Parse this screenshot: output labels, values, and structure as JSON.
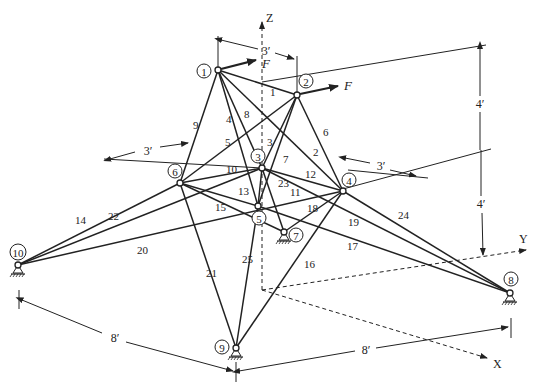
{
  "figure": {
    "type": "space-truss",
    "axes": {
      "x": "X",
      "y": "Y",
      "z": "Z"
    },
    "loads": [
      {
        "node": 1,
        "label": "F"
      },
      {
        "node": 2,
        "label": "F"
      }
    ],
    "dimensions": {
      "top_width": "3′",
      "left_offset": "3′",
      "right_offset": "3′",
      "upper_height": "4′",
      "lower_height": "4′",
      "base_left": "8′",
      "base_right": "8′"
    },
    "nodes": [
      {
        "id": "1",
        "x": 218,
        "y": 70,
        "lx": 204,
        "ly": 71
      },
      {
        "id": "2",
        "x": 297,
        "y": 95,
        "lx": 306,
        "ly": 81
      },
      {
        "id": "3",
        "x": 262,
        "y": 168,
        "lx": 258,
        "ly": 156
      },
      {
        "id": "4",
        "x": 343,
        "y": 191,
        "lx": 349,
        "ly": 180
      },
      {
        "id": "5",
        "x": 258,
        "y": 206,
        "lx": 259,
        "ly": 218
      },
      {
        "id": "6",
        "x": 180,
        "y": 183,
        "lx": 175,
        "ly": 171
      },
      {
        "id": "7",
        "x": 284,
        "y": 232,
        "lx": 296,
        "ly": 235
      },
      {
        "id": "8",
        "x": 510,
        "y": 293,
        "lx": 511,
        "ly": 279
      },
      {
        "id": "9",
        "x": 236,
        "y": 348,
        "lx": 222,
        "ly": 347
      },
      {
        "id": "10",
        "x": 18,
        "y": 265,
        "lx": 18,
        "ly": 252
      }
    ],
    "supports": [
      "7",
      "8",
      "9",
      "10"
    ],
    "members": [
      {
        "id": "1",
        "a": "1",
        "b": "2",
        "lx": 270,
        "ly": 96
      },
      {
        "id": "2",
        "a": "1",
        "b": "4",
        "lx": 313,
        "ly": 156
      },
      {
        "id": "3",
        "a": "2",
        "b": "5",
        "lx": 267,
        "ly": 146
      },
      {
        "id": "4",
        "a": "1",
        "b": "5",
        "lx": 226,
        "ly": 123
      },
      {
        "id": "5",
        "a": "2",
        "b": "6",
        "lx": 225,
        "ly": 146
      },
      {
        "id": "6",
        "a": "2",
        "b": "4",
        "lx": 323,
        "ly": 136
      },
      {
        "id": "7",
        "a": "2",
        "b": "3",
        "lx": 283,
        "ly": 163
      },
      {
        "id": "8",
        "a": "1",
        "b": "3",
        "lx": 244,
        "ly": 118
      },
      {
        "id": "9",
        "a": "1",
        "b": "6",
        "lx": 193,
        "ly": 129
      },
      {
        "id": "10",
        "a": "6",
        "b": "3",
        "lx": 226,
        "ly": 173
      },
      {
        "id": "11",
        "a": "3",
        "b": "5",
        "lx": 290,
        "ly": 196,
        "note": "4-5"
      },
      {
        "id": "12",
        "a": "3",
        "b": "4",
        "lx": 305,
        "ly": 178
      },
      {
        "id": "13",
        "a": "6",
        "b": "5",
        "lx": 238,
        "ly": 195
      },
      {
        "id": "14",
        "a": "10",
        "b": "3",
        "lx": 75,
        "ly": 224
      },
      {
        "id": "15",
        "a": "6",
        "b": "7",
        "lx": 215,
        "ly": 211
      },
      {
        "id": "16",
        "a": "4",
        "b": "9",
        "lx": 304,
        "ly": 268
      },
      {
        "id": "17",
        "a": "5",
        "b": "8",
        "lx": 347,
        "ly": 250
      },
      {
        "id": "18",
        "a": "4",
        "b": "7",
        "lx": 307,
        "ly": 212
      },
      {
        "id": "19",
        "a": "3",
        "b": "8",
        "lx": 348,
        "ly": 226
      },
      {
        "id": "20",
        "a": "10",
        "b": "4",
        "lx": 137,
        "ly": 254
      },
      {
        "id": "21",
        "a": "6",
        "b": "9",
        "lx": 206,
        "ly": 277
      },
      {
        "id": "22",
        "a": "10",
        "b": "6",
        "lx": 108,
        "ly": 220
      },
      {
        "id": "23",
        "a": "3",
        "b": "7",
        "lx": 278,
        "ly": 187
      },
      {
        "id": "24",
        "a": "4",
        "b": "8",
        "lx": 398,
        "ly": 219
      },
      {
        "id": "25",
        "a": "5",
        "b": "9",
        "lx": 242,
        "ly": 263
      }
    ]
  }
}
